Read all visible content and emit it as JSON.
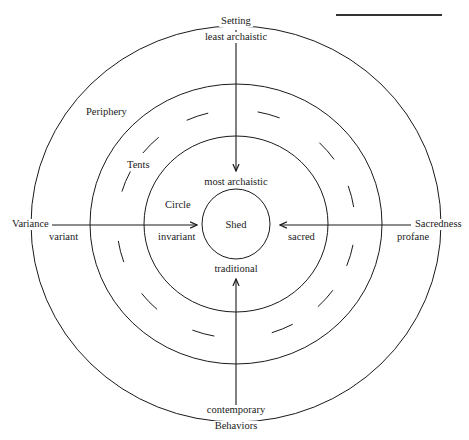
{
  "diagram": {
    "colors": {
      "stroke": "#1a1a1a",
      "background": "#ffffff"
    },
    "center": {
      "x": 236,
      "y": 224
    },
    "rings": [
      {
        "name": "outer-ring",
        "rx": 205,
        "ry": 198
      },
      {
        "name": "tents-outer-ring",
        "rx": 146,
        "ry": 140
      },
      {
        "name": "circle-ring",
        "rx": 92,
        "ry": 88
      },
      {
        "name": "shed-ring",
        "rx": 34,
        "ry": 35
      }
    ],
    "dashed_ring": {
      "rx": 119,
      "ry": 114,
      "dash_arc_deg": 11,
      "dash_centers_deg": [
        16,
        50,
        76,
        106,
        131,
        157,
        196,
        227,
        256,
        292,
        314,
        341
      ]
    },
    "axes": [
      {
        "name": "setting-axis",
        "x1": 236,
        "y1": 30,
        "x2": 236,
        "y2": 171,
        "arrow": "end"
      },
      {
        "name": "behaviors-axis",
        "x1": 236,
        "y1": 410,
        "x2": 236,
        "y2": 279,
        "arrow": "end"
      },
      {
        "name": "variance-axis",
        "x1": 52,
        "y1": 225,
        "x2": 197,
        "y2": 225,
        "arrow": "end"
      },
      {
        "name": "sacredness-axis",
        "x1": 411,
        "y1": 225,
        "x2": 280,
        "y2": 225,
        "arrow": "end"
      }
    ],
    "top_rule": {
      "x1": 336,
      "y1": 15,
      "x2": 442,
      "y2": 15
    },
    "labels": {
      "setting": "Setting",
      "least_archaistic": "least archaistic",
      "periphery": "Periphery",
      "tents": "Tents",
      "most_archaistic": "most archaistic",
      "circle": "Circle",
      "shed": "Shed",
      "variance": "Variance",
      "variant": "variant",
      "invariant": "invariant",
      "sacred": "sacred",
      "sacredness": "Sacredness",
      "profane": "profane",
      "traditional": "traditional",
      "contemporary": "contemporary",
      "behaviors": "Behaviors"
    }
  }
}
